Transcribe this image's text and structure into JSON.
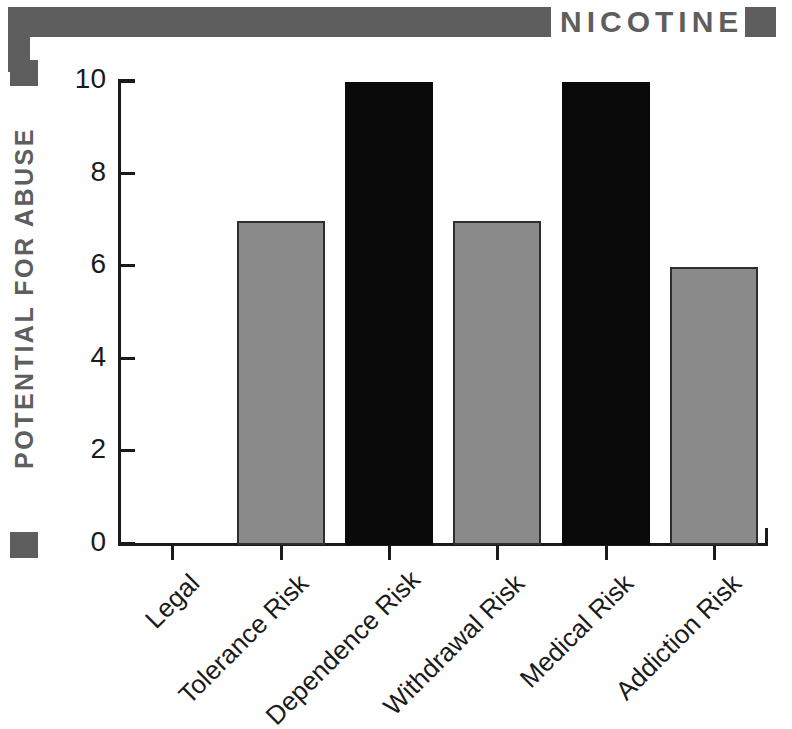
{
  "header": {
    "title": "NICOTINE",
    "bar_color": "#5e5e5e"
  },
  "y_axis": {
    "title": "POTENTIAL FOR ABUSE",
    "ticks": [
      "0",
      "2",
      "4",
      "6",
      "8",
      "10"
    ]
  },
  "chart_data": {
    "type": "bar",
    "title": "NICOTINE",
    "xlabel": "",
    "ylabel": "POTENTIAL FOR ABUSE",
    "ylim": [
      0,
      10
    ],
    "ytick_values": [
      0,
      2,
      4,
      6,
      8,
      10
    ],
    "grid": false,
    "legend": null,
    "categories": [
      "Legal",
      "Tolerance Risk",
      "Dependence Risk",
      "Withdrawal Risk",
      "Medical Risk",
      "Addiction Risk"
    ],
    "values": [
      0,
      7,
      10,
      7,
      10,
      6
    ],
    "bar_colors": [
      "#8a8a8a",
      "#8a8a8a",
      "#0a0a0a",
      "#8a8a8a",
      "#0a0a0a",
      "#8a8a8a"
    ],
    "colors": {
      "gray_bar": "#8a8a8a",
      "black_bar": "#0a0a0a",
      "axis": "#1a1a1a",
      "accent": "#5e5e5e",
      "background": "#ffffff"
    }
  }
}
